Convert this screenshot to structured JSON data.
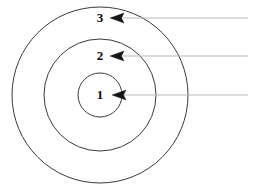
{
  "diagram": {
    "type": "concentric-circles-callout",
    "background_color": "#ffffff",
    "ring_stroke_color": "#3a3a3a",
    "leader_line_color": "#b9b9b9",
    "arrow_color": "#151515",
    "label_color": "#0b0b0b",
    "center": {
      "x": 100,
      "y": 95
    },
    "rings": [
      {
        "id": "ring-1",
        "label": "1",
        "radius": 22,
        "label_x": 100,
        "label_y": 95,
        "arrow_tip_x": 113,
        "arrow_tip_y": 95,
        "arrow_tail_x": 126,
        "leader_y": 95,
        "leader_end_x": 248
      },
      {
        "id": "ring-2",
        "label": "2",
        "radius": 56,
        "label_x": 100,
        "label_y": 56,
        "arrow_tip_x": 110,
        "arrow_tip_y": 56,
        "arrow_tail_x": 125,
        "leader_y": 56,
        "leader_end_x": 248
      },
      {
        "id": "ring-3",
        "label": "3",
        "radius": 88,
        "label_x": 100,
        "label_y": 18,
        "arrow_tip_x": 110,
        "arrow_tip_y": 18,
        "arrow_tail_x": 125,
        "leader_y": 18,
        "leader_end_x": 248
      }
    ]
  }
}
